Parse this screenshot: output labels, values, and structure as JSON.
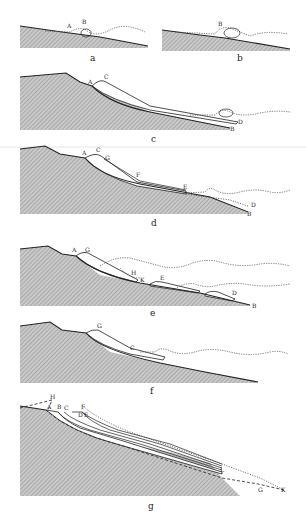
{
  "figure": {
    "panels": [
      {
        "id": "a",
        "caption": "a",
        "labels": [
          "A",
          "B"
        ]
      },
      {
        "id": "b",
        "caption": "b",
        "labels": [
          "B"
        ]
      },
      {
        "id": "c",
        "caption": "c",
        "labels": [
          "A",
          "C",
          "D",
          "B"
        ]
      },
      {
        "id": "d",
        "caption": "d",
        "labels": [
          "A",
          "C",
          "G",
          "F",
          "E",
          "D",
          "B"
        ]
      },
      {
        "id": "e",
        "caption": "e",
        "labels": [
          "A",
          "G",
          "H",
          "K",
          "E",
          "D",
          "B"
        ]
      },
      {
        "id": "f",
        "caption": "f",
        "labels": [
          "G",
          "C"
        ]
      },
      {
        "id": "g",
        "caption": "g",
        "labels": [
          "H",
          "A",
          "B",
          "C",
          "D",
          "E",
          "F",
          "L",
          "G",
          "K"
        ]
      }
    ]
  }
}
